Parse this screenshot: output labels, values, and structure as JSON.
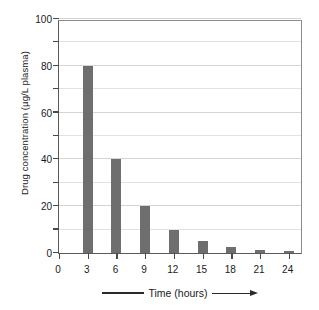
{
  "chart_data": {
    "type": "bar",
    "title": "",
    "subtitle": "",
    "xlabel": "Time (hours)",
    "ylabel": "Drug concentration (µg/L plasma)",
    "categories": [
      "3",
      "6",
      "9",
      "12",
      "15",
      "18",
      "21",
      "24"
    ],
    "values": [
      80,
      40,
      20,
      10,
      5,
      2.5,
      1.5,
      1
    ],
    "series": [
      {
        "name": "Drug concentration",
        "values": [
          80,
          40,
          20,
          10,
          5,
          2.5,
          1.5,
          1
        ]
      }
    ],
    "x_tick_labels": [
      "0",
      "3",
      "6",
      "9",
      "12",
      "15",
      "18",
      "21",
      "24"
    ],
    "x_tick_values": [
      0,
      3,
      6,
      9,
      12,
      15,
      18,
      21,
      24
    ],
    "y_tick_labels": [
      "0",
      "20",
      "40",
      "60",
      "80",
      "100"
    ],
    "y_tick_values": [
      0,
      20,
      40,
      60,
      80,
      100
    ],
    "y_minor_tick_values": [
      10,
      30,
      50,
      70,
      90
    ],
    "xlim": [
      0,
      25.5
    ],
    "ylim": [
      0,
      100
    ],
    "grid": true,
    "grid_axis": "y",
    "legend": false,
    "legend_position": "none",
    "bar_color": "#6e6e6e",
    "background_color": "#ffffff",
    "axis_color": "#4a4a4a",
    "grid_color": "#e2e2e2",
    "annotations": []
  },
  "figure": {
    "arrow_note": "Time (hours) axis title flanked by a plain rule on the left and a right-pointing arrow on the right"
  }
}
